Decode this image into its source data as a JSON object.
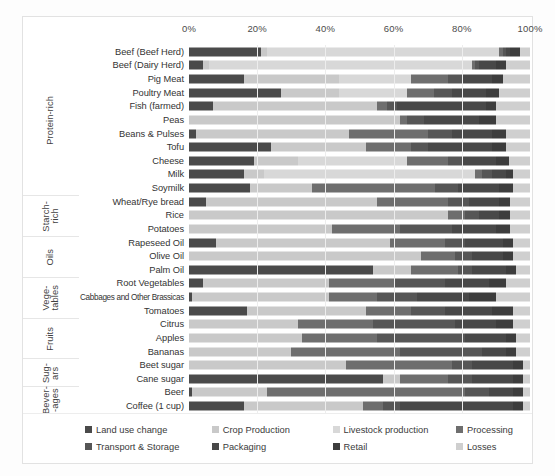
{
  "chart_data": {
    "type": "bar",
    "subtype": "stacked-horizontal-100percent",
    "title": "",
    "xlabel": "",
    "ylabel": "",
    "xlim": [
      0,
      100
    ],
    "xticks": [
      "0%",
      "20%",
      "40%",
      "60%",
      "80%",
      "100%"
    ],
    "xtick_values": [
      0,
      20,
      40,
      60,
      80,
      100
    ],
    "grid": true,
    "legend_position": "bottom",
    "series": [
      {
        "name": "Land use change",
        "color": "#4a4a4a"
      },
      {
        "name": "Crop Production",
        "color": "#c9c9c9"
      },
      {
        "name": "Livestock production",
        "color": "#d8d8d8"
      },
      {
        "name": "Processing",
        "color": "#6e6e6e"
      },
      {
        "name": "Transport & Storage",
        "color": "#565656"
      },
      {
        "name": "Packaging",
        "color": "#484848"
      },
      {
        "name": "Retail",
        "color": "#3d3d3d"
      },
      {
        "name": "Losses",
        "color": "#cfcfcf"
      }
    ],
    "groups": [
      {
        "name": "Protein-rich",
        "label": "Protein-rich",
        "count": 11
      },
      {
        "name": "Starch-rich",
        "label": "Starch-\nrich",
        "count": 3
      },
      {
        "name": "Oils",
        "label": "Oils",
        "count": 3
      },
      {
        "name": "Vegetables",
        "label": "Vege-\ntables",
        "count": 3
      },
      {
        "name": "Fruits",
        "label": "Fruits",
        "count": 3
      },
      {
        "name": "Sugars",
        "label": "Sug-\nars",
        "count": 2
      },
      {
        "name": "Beverages",
        "label": "Bever-\n-ages",
        "count": 2
      }
    ],
    "categories": [
      "Beef (Beef Herd)",
      "Beef (Dairy Herd)",
      "Pig Meat",
      "Poultry Meat",
      "Fish (farmed)",
      "Peas",
      "Beans & Pulses",
      "Tofu",
      "Cheese",
      "Milk",
      "Soymilk",
      "Wheat/Rye bread",
      "Rice",
      "Potatoes",
      "Rapeseed Oil",
      "Olive Oil",
      "Palm Oil",
      "Root Vegetables",
      "Cabbages and Other Brassicas",
      "Tomatoes",
      "Citrus",
      "Apples",
      "Bananas",
      "Beet sugar",
      "Cane sugar",
      "Beer",
      "Coffee (1 cup)"
    ],
    "rows": [
      {
        "category": "Beef (Beef Herd)",
        "values": [
          21,
          2,
          68,
          1,
          1,
          1,
          3,
          3
        ]
      },
      {
        "category": "Beef (Dairy Herd)",
        "values": [
          4,
          2,
          77,
          1,
          1,
          5,
          3,
          7
        ]
      },
      {
        "category": "Pig Meat",
        "values": [
          16,
          28,
          21,
          11,
          4,
          9,
          3,
          8
        ]
      },
      {
        "category": "Poultry Meat",
        "values": [
          27,
          17,
          20,
          8,
          5,
          10,
          4,
          9
        ]
      },
      {
        "category": "Fish (farmed)",
        "values": [
          7,
          48,
          0,
          3,
          3,
          26,
          3,
          10
        ]
      },
      {
        "category": "Peas",
        "values": [
          0,
          62,
          0,
          2,
          5,
          16,
          5,
          10
        ]
      },
      {
        "category": "Beans & Pulses",
        "values": [
          2,
          45,
          0,
          23,
          7,
          12,
          4,
          7
        ]
      },
      {
        "category": "Tofu",
        "values": [
          24,
          28,
          0,
          13,
          5,
          19,
          4,
          7
        ]
      },
      {
        "category": "Cheese",
        "values": [
          19,
          13,
          32,
          12,
          4,
          10,
          4,
          6
        ]
      },
      {
        "category": "Milk",
        "values": [
          16,
          6,
          62,
          2,
          3,
          4,
          2,
          5
        ]
      },
      {
        "category": "Soymilk",
        "values": [
          18,
          18,
          0,
          36,
          7,
          12,
          4,
          5
        ]
      },
      {
        "category": "Wheat/Rye bread",
        "values": [
          5,
          50,
          0,
          21,
          6,
          9,
          3,
          6
        ]
      },
      {
        "category": "Rice",
        "values": [
          0,
          76,
          0,
          5,
          4,
          6,
          3,
          6
        ]
      },
      {
        "category": "Potatoes",
        "values": [
          0,
          42,
          0,
          20,
          15,
          13,
          4,
          6
        ]
      },
      {
        "category": "Rapeseed Oil",
        "values": [
          8,
          51,
          0,
          16,
          6,
          11,
          3,
          5
        ]
      },
      {
        "category": "Olive Oil",
        "values": [
          0,
          68,
          0,
          10,
          5,
          9,
          3,
          5
        ]
      },
      {
        "category": "Palm Oil",
        "values": [
          54,
          11,
          0,
          14,
          4,
          10,
          3,
          4
        ]
      },
      {
        "category": "Root Vegetables",
        "values": [
          4,
          37,
          0,
          19,
          15,
          13,
          5,
          7
        ]
      },
      {
        "category": "Cabbages and Other Brassicas",
        "values": [
          1,
          40,
          0,
          14,
          12,
          15,
          8,
          10
        ]
      },
      {
        "category": "Tomatoes",
        "values": [
          17,
          35,
          0,
          13,
          10,
          14,
          6,
          5
        ]
      },
      {
        "category": "Citrus",
        "values": [
          0,
          32,
          0,
          22,
          24,
          12,
          5,
          5
        ]
      },
      {
        "category": "Apples",
        "values": [
          0,
          33,
          0,
          22,
          26,
          12,
          3,
          4
        ]
      },
      {
        "category": "Bananas",
        "values": [
          0,
          30,
          0,
          32,
          24,
          7,
          3,
          4
        ]
      },
      {
        "category": "Beet sugar",
        "values": [
          0,
          46,
          0,
          31,
          6,
          12,
          3,
          2
        ]
      },
      {
        "category": "Cane sugar",
        "values": [
          57,
          5,
          0,
          14,
          7,
          12,
          3,
          2
        ]
      },
      {
        "category": "Beer",
        "values": [
          1,
          22,
          0,
          58,
          7,
          7,
          3,
          2
        ]
      },
      {
        "category": "Coffee (1 cup)",
        "values": [
          16,
          35,
          0,
          6,
          5,
          33,
          3,
          2
        ]
      }
    ]
  }
}
